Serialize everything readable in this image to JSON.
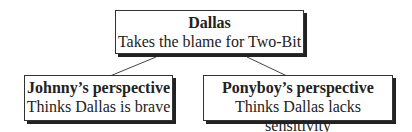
{
  "diagram": {
    "root": {
      "title": "Dallas",
      "subtitle": "Takes the blame for Two-Bit"
    },
    "children": [
      {
        "title": "Johnny’s perspective",
        "subtitle": "Thinks Dallas is brave"
      },
      {
        "title": "Ponyboy’s perspective",
        "subtitle": "Thinks Dallas lacks sensitivity"
      }
    ]
  }
}
